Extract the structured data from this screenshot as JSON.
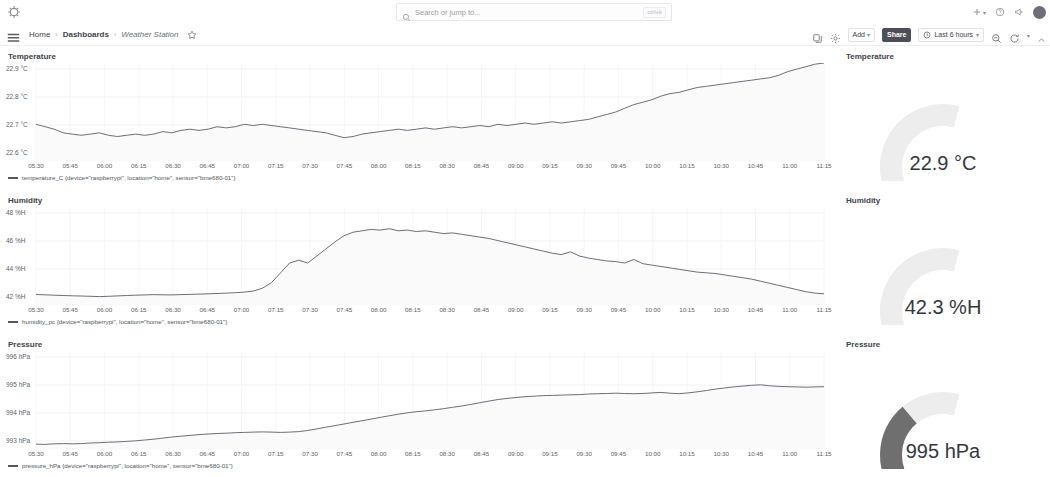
{
  "topnav": {
    "logo_icon": "grafana-logo-icon",
    "search": {
      "placeholder": "Search or jump to...",
      "icon": "search-icon",
      "shortcut": "ctrl+k"
    },
    "right_items": [
      {
        "name": "new-menu",
        "label": "+",
        "caret": "▾",
        "icon": "plus-icon"
      },
      {
        "name": "help-menu",
        "label": "",
        "caret": "",
        "icon": "help-circle-icon"
      },
      {
        "name": "news-menu",
        "label": "",
        "caret": "",
        "icon": "megaphone-icon"
      },
      {
        "name": "profile-menu",
        "label": "",
        "caret": "",
        "icon": "avatar-icon"
      }
    ]
  },
  "breadcrumb": {
    "menu_icon": "hamburger-menu-icon",
    "items": [
      {
        "label": "Home",
        "style": "normal"
      },
      {
        "label": "Dashboards",
        "style": "bold"
      },
      {
        "label": "Weather Station",
        "style": "italic"
      }
    ],
    "separator": "›",
    "star_icon": "star-outline-icon"
  },
  "toolbar": {
    "icons": [
      {
        "name": "panel-copy-icon",
        "glyph": "copy"
      },
      {
        "name": "dashboard-settings-icon",
        "glyph": "gear"
      }
    ],
    "add_label": "Add",
    "add_caret": "▾",
    "share_label": "Share",
    "time_range": "Last 6 hours",
    "time_icon": "clock-icon",
    "time_caret": "▾",
    "zoom_out_icon": "zoom-out-icon",
    "refresh_icon": "refresh-icon",
    "refresh_caret": "▾",
    "collapse_icon": "chevron-up-icon"
  },
  "panels": {
    "temperature": {
      "title": "Temperature",
      "legend": "temperature_C {device=\"raspberrypi\", location=\"home\", sensor=\"bme680-01\"}",
      "legend_color": "#55595f"
    },
    "humidity": {
      "title": "Humidity",
      "legend": "humidity_pc {device=\"raspberrypi\", location=\"home\", sensor=\"bme680-01\"}",
      "legend_color": "#55595f"
    },
    "pressure": {
      "title": "Pressure",
      "legend": "pressure_hPa {device=\"raspberrypi\", location=\"home\", sensor=\"bme680-01\"}",
      "legend_color": "#55595f"
    }
  },
  "gauges": [
    {
      "name": "temperature-gauge",
      "title": "Temperature",
      "value_text": "22.9 °C",
      "value": 22.9,
      "fill_fraction": 0.34,
      "color": "#2b2b2b",
      "track_color": "#ededed"
    },
    {
      "name": "humidity-gauge",
      "title": "Humidity",
      "value_text": "42.3 %H",
      "value": 42.3,
      "fill_fraction": 0.32,
      "color": "#3a3a3a",
      "track_color": "#ededed"
    },
    {
      "name": "pressure-gauge",
      "title": "Pressure",
      "value_text": "995 hPa",
      "value": 995,
      "fill_fraction": 0.78,
      "color": "#6f6f6f",
      "track_color": "#ededed"
    }
  ],
  "chart_data": [
    {
      "type": "line",
      "title": "Temperature",
      "ylabel": "",
      "xlabel": "",
      "yticks": [
        "22.9 °C",
        "22.8 °C",
        "22.7 °C",
        "22.6 °C"
      ],
      "ylim": [
        22.55,
        22.95
      ],
      "grid": true,
      "legend_position": "bottom-left",
      "xticks": [
        "05:30",
        "05:45",
        "06:00",
        "06:15",
        "06:30",
        "06:45",
        "07:00",
        "07:15",
        "07:30",
        "07:45",
        "08:00",
        "08:15",
        "08:30",
        "08:45",
        "09:00",
        "09:15",
        "09:30",
        "09:45",
        "10:00",
        "10:15",
        "10:30",
        "10:45",
        "11:00",
        "11:15"
      ],
      "series": [
        {
          "name": "temperature_C {device=\"raspberrypi\", location=\"home\", sensor=\"bme680-01\"}",
          "unit": "°C",
          "values": [
            22.7,
            22.69,
            22.68,
            22.665,
            22.66,
            22.655,
            22.66,
            22.665,
            22.655,
            22.65,
            22.655,
            22.66,
            22.655,
            22.66,
            22.67,
            22.665,
            22.675,
            22.68,
            22.675,
            22.68,
            22.69,
            22.685,
            22.69,
            22.7,
            22.695,
            22.7,
            22.695,
            22.69,
            22.685,
            22.68,
            22.675,
            22.67,
            22.665,
            22.655,
            22.645,
            22.65,
            22.66,
            22.665,
            22.67,
            22.675,
            22.68,
            22.675,
            22.68,
            22.685,
            22.68,
            22.685,
            22.69,
            22.685,
            22.69,
            22.695,
            22.69,
            22.7,
            22.695,
            22.7,
            22.705,
            22.7,
            22.705,
            22.71,
            22.705,
            22.71,
            22.715,
            22.72,
            22.73,
            22.74,
            22.75,
            22.765,
            22.78,
            22.79,
            22.8,
            22.815,
            22.825,
            22.83,
            22.84,
            22.85,
            22.855,
            22.86,
            22.865,
            22.87,
            22.875,
            22.88,
            22.885,
            22.89,
            22.9,
            22.915,
            22.925,
            22.935,
            22.945,
            22.95
          ]
        }
      ]
    },
    {
      "type": "line",
      "title": "Humidity",
      "ylabel": "",
      "xlabel": "",
      "yticks": [
        "48 %H",
        "46 %H",
        "44 %H",
        "42 %H"
      ],
      "ylim": [
        41.6,
        48.6
      ],
      "grid": true,
      "legend_position": "bottom-left",
      "xticks": [
        "05:30",
        "05:45",
        "06:00",
        "06:15",
        "06:30",
        "06:45",
        "07:00",
        "07:15",
        "07:30",
        "07:45",
        "08:00",
        "08:15",
        "08:30",
        "08:45",
        "09:00",
        "09:15",
        "09:30",
        "09:45",
        "10:00",
        "10:15",
        "10:30",
        "10:45",
        "11:00",
        "11:15"
      ],
      "series": [
        {
          "name": "humidity_pc {device=\"raspberrypi\", location=\"home\", sensor=\"bme680-01\"}",
          "unit": "%H",
          "values": [
            42.35,
            42.33,
            42.3,
            42.28,
            42.26,
            42.24,
            42.22,
            42.2,
            42.22,
            42.25,
            42.28,
            42.3,
            42.32,
            42.34,
            42.33,
            42.32,
            42.34,
            42.36,
            42.38,
            42.4,
            42.42,
            42.45,
            42.48,
            42.52,
            42.6,
            42.8,
            43.2,
            43.9,
            44.6,
            44.8,
            44.6,
            45.1,
            45.6,
            46.1,
            46.55,
            46.8,
            46.9,
            47.0,
            46.95,
            47.05,
            46.9,
            46.95,
            46.85,
            46.9,
            46.8,
            46.7,
            46.75,
            46.65,
            46.55,
            46.45,
            46.35,
            46.2,
            46.05,
            45.9,
            45.75,
            45.6,
            45.45,
            45.3,
            45.2,
            45.4,
            45.1,
            44.95,
            44.85,
            44.75,
            44.7,
            44.6,
            44.85,
            44.55,
            44.45,
            44.35,
            44.25,
            44.15,
            44.05,
            43.95,
            43.9,
            43.85,
            43.75,
            43.65,
            43.55,
            43.45,
            43.3,
            43.15,
            43.0,
            42.85,
            42.7,
            42.55,
            42.45,
            42.4
          ]
        }
      ]
    },
    {
      "type": "line",
      "title": "Pressure",
      "ylabel": "",
      "xlabel": "",
      "yticks": [
        "996 hPa",
        "995 hPa",
        "994 hPa",
        "993 hPa"
      ],
      "ylim": [
        992.8,
        996.4
      ],
      "grid": true,
      "legend_position": "bottom-left",
      "xticks": [
        "05:30",
        "05:45",
        "06:00",
        "06:15",
        "06:30",
        "06:45",
        "07:00",
        "07:15",
        "07:30",
        "07:45",
        "08:00",
        "08:15",
        "08:30",
        "08:45",
        "09:00",
        "09:15",
        "09:30",
        "09:45",
        "10:00",
        "10:15",
        "10:30",
        "10:45",
        "11:00",
        "11:15"
      ],
      "series": [
        {
          "name": "pressure_hPa {device=\"raspberrypi\", location=\"home\", sensor=\"bme680-01\"}",
          "unit": "hPa",
          "values": [
            992.98,
            992.97,
            992.99,
            993.0,
            992.99,
            993.0,
            993.02,
            993.03,
            993.05,
            993.06,
            993.08,
            993.1,
            993.13,
            993.16,
            993.2,
            993.24,
            993.27,
            993.3,
            993.33,
            993.35,
            993.37,
            993.38,
            993.4,
            993.41,
            993.42,
            993.43,
            993.42,
            993.41,
            993.42,
            993.44,
            993.48,
            993.54,
            993.6,
            993.66,
            993.72,
            993.78,
            993.84,
            993.9,
            993.96,
            994.02,
            994.08,
            994.13,
            994.17,
            994.2,
            994.24,
            994.28,
            994.33,
            994.38,
            994.44,
            994.5,
            994.56,
            994.62,
            994.66,
            994.69,
            994.72,
            994.74,
            994.76,
            994.77,
            994.78,
            994.79,
            994.8,
            994.82,
            994.83,
            994.84,
            994.85,
            994.84,
            994.83,
            994.84,
            994.86,
            994.88,
            994.85,
            994.83,
            994.86,
            994.9,
            994.95,
            995.0,
            995.04,
            995.08,
            995.11,
            995.14,
            995.16,
            995.12,
            995.1,
            995.09,
            995.08,
            995.07,
            995.08,
            995.09
          ]
        }
      ]
    }
  ]
}
